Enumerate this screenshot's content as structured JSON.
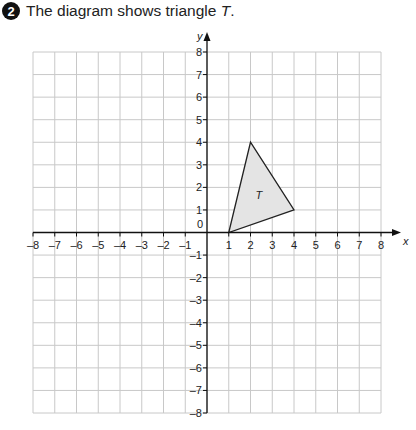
{
  "question": {
    "number": "2",
    "text_prefix": "The diagram shows triangle ",
    "text_var": "T",
    "text_suffix": "."
  },
  "diagram": {
    "x_axis_label": "x",
    "y_axis_label": "y",
    "origin_label": "0",
    "x_range": [
      -8,
      8
    ],
    "y_range": [
      -8,
      8
    ],
    "x_ticks": [
      "-8",
      "-7",
      "-6",
      "-5",
      "-4",
      "-3",
      "-2",
      "-1",
      "1",
      "2",
      "3",
      "4",
      "5",
      "6",
      "7",
      "8"
    ],
    "y_ticks": [
      "8",
      "7",
      "6",
      "5",
      "4",
      "3",
      "2",
      "1",
      "-1",
      "-2",
      "-3",
      "-4",
      "-5",
      "-6",
      "-7",
      "-8"
    ],
    "shape": {
      "label": "T",
      "vertices": [
        [
          1,
          0
        ],
        [
          2,
          4
        ],
        [
          4,
          1
        ]
      ],
      "fill": "#e4e4e4",
      "stroke": "#222222"
    },
    "grid_color": "#c8c8c8"
  }
}
